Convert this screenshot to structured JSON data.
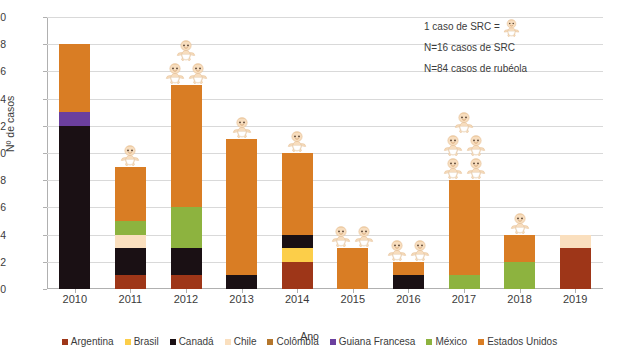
{
  "chart_data": {
    "type": "bar",
    "stacked": true,
    "title": "",
    "xlabel": "Ano",
    "ylabel": "Nº de casos",
    "ylim": [
      0,
      20
    ],
    "ytick_step": 2,
    "grid": true,
    "legend_position": "bottom",
    "categories": [
      "2010",
      "2011",
      "2012",
      "2013",
      "2014",
      "2015",
      "2016",
      "2017",
      "2018",
      "2019"
    ],
    "series": [
      {
        "name": "Argentina",
        "color": "#9e3618",
        "values": [
          0,
          1,
          1,
          0,
          2,
          0,
          0,
          0,
          0,
          3
        ]
      },
      {
        "name": "Brasil",
        "color": "#fcce49",
        "values": [
          0,
          0,
          0,
          0,
          1,
          0,
          0,
          0,
          0,
          0
        ]
      },
      {
        "name": "Canadá",
        "color": "#1a1014",
        "values": [
          12,
          2,
          2,
          1,
          1,
          0,
          1,
          0,
          0,
          0
        ]
      },
      {
        "name": "Chile",
        "color": "#fadfbe",
        "values": [
          0,
          1,
          0,
          0,
          0,
          0,
          0,
          0,
          0,
          1
        ]
      },
      {
        "name": "Colômbia",
        "color": "#b4762c",
        "values": [
          0,
          0,
          0,
          0,
          0,
          0,
          0,
          0,
          0,
          0
        ]
      },
      {
        "name": "Guiana Francesa",
        "color": "#6b3f9e",
        "values": [
          1,
          0,
          0,
          0,
          0,
          0,
          0,
          0,
          0,
          0
        ]
      },
      {
        "name": "México",
        "color": "#8db33f",
        "values": [
          0,
          1,
          3,
          0,
          0,
          0,
          0,
          1,
          2,
          0
        ]
      },
      {
        "name": "Estados Unidos",
        "color": "#d97d24",
        "values": [
          5,
          4,
          9,
          10,
          6,
          3,
          1,
          7,
          2,
          0
        ]
      }
    ],
    "totals": [
      18,
      9,
      15,
      11,
      10,
      3,
      2,
      8,
      4,
      4
    ],
    "src_icon_counts": [
      0,
      1,
      3,
      1,
      1,
      2,
      2,
      5,
      1,
      0
    ],
    "ytick_labels": [
      "0",
      "2",
      "4",
      "6",
      "8",
      "10",
      "12",
      "14",
      "16",
      "18",
      "20"
    ]
  },
  "annotation": {
    "line1": "1 caso de SRC =",
    "line2": "N=16 casos de SRC",
    "line3": "N=84 casos de rubéola"
  },
  "icons": {
    "src_baby": "baby-icon"
  }
}
